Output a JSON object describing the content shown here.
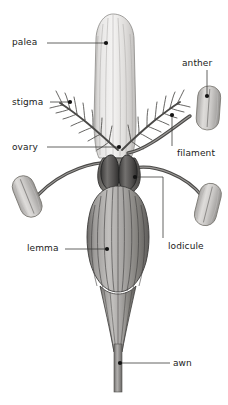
{
  "figure": {
    "background_color": "#ffffff",
    "line_color": "#1b1b1b",
    "label_color": "#1b1b1b",
    "width": 228,
    "height": 405
  },
  "labels": [
    {
      "id": "palea",
      "text": "palea"
    },
    {
      "id": "anther",
      "text": "anther"
    },
    {
      "id": "stigma",
      "text": "stigma"
    },
    {
      "id": "ovary",
      "text": "ovary"
    },
    {
      "id": "filament",
      "text": "filament"
    },
    {
      "id": "lodicule",
      "text": "lodicule"
    },
    {
      "id": "lemma",
      "text": "lemma"
    },
    {
      "id": "awn",
      "text": "awn"
    }
  ],
  "parts": {
    "palea": {
      "fill_light": "#f0efee",
      "fill_mid": "#d6d4d2",
      "stroke": "#6b6b6b"
    },
    "lemma": {
      "fill_light": "#b9b7b5",
      "fill_mid": "#8d8b89",
      "fill_dark": "#5f5d5c",
      "stroke": "#3a3a39"
    },
    "anther": {
      "fill_light": "#dcdad8",
      "fill_mid": "#b6b4b2",
      "stroke": "#6e6c6a"
    },
    "lodicule": {
      "fill_light": "#6e6c6a",
      "fill_dark": "#3b3a39",
      "stroke": "#272726"
    },
    "ovary": {
      "fill_light": "#9a9896",
      "fill_mid": "#706e6c",
      "stroke": "#3a3938"
    },
    "stigma": {
      "stroke": "#4a4947"
    },
    "filament": {
      "stroke": "#4a4947"
    },
    "awn": {
      "fill_light": "#9f9d9b",
      "fill_mid": "#777573",
      "stroke": "#4a4947"
    }
  }
}
